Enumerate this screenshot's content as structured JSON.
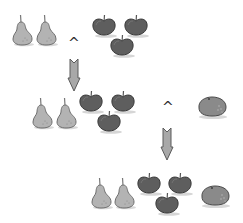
{
  "diagram": {
    "type": "fruit-set-combination",
    "colors": {
      "pear_fill": "#b3b3b3",
      "pear_outline": "#6e6e6e",
      "apple_fill": "#5e5e5e",
      "apple_outline": "#3a3a3a",
      "orange_fill": "#8a8a8a",
      "orange_outline": "#4a4a4a",
      "arrow_fill": "#a8a8a8",
      "arrow_outline": "#5a5a5a",
      "operator": "#2e2e2e"
    },
    "steps": [
      {
        "id": "step1",
        "items": [
          "pear",
          "pear",
          "apple",
          "apple",
          "apple"
        ],
        "operator": "^",
        "operator_target": "row2"
      },
      {
        "id": "step2",
        "items": [
          "pear",
          "pear",
          "apple",
          "apple",
          "apple"
        ],
        "operator": "^",
        "operand": [
          "orange"
        ]
      },
      {
        "id": "step3",
        "items": [
          "pear",
          "pear",
          "apple",
          "apple",
          "apple",
          "orange"
        ]
      }
    ],
    "operators": {
      "op1": "^",
      "op2": "^"
    },
    "arrows": [
      "down",
      "down"
    ]
  }
}
